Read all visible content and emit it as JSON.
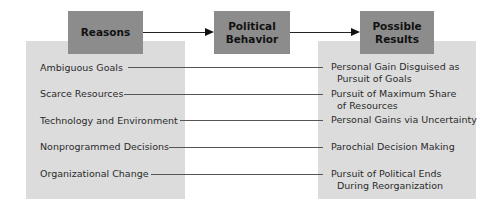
{
  "header_boxes": {
    "reasons": "Reasons",
    "behavior_line1": "Political",
    "behavior_line2": "Behavior",
    "results_line1": "Possible",
    "results_line2": "Results"
  },
  "rows": [
    {
      "reason": "Ambiguous Goals",
      "result_line1": "Personal Gain Disguised as",
      "result_line2": "Pursuit of Goals"
    },
    {
      "reason": "Scarce Resources",
      "result_line1": "Pursuit of Maximum Share",
      "result_line2": "of Resources"
    },
    {
      "reason": "Technology and Environment",
      "result_line1": "Personal Gains via Uncertainty",
      "result_line2": ""
    },
    {
      "reason": "Nonprogrammed Decisions",
      "result_line1": "Parochial Decision Making",
      "result_line2": ""
    },
    {
      "reason": "Organizational Change",
      "result_line1": "Pursuit of Political Ends",
      "result_line2": "During Reorganization"
    }
  ],
  "colors": {
    "panel": "#dcdcdc",
    "header_box": "#8c8c8c",
    "line": "#555555"
  }
}
